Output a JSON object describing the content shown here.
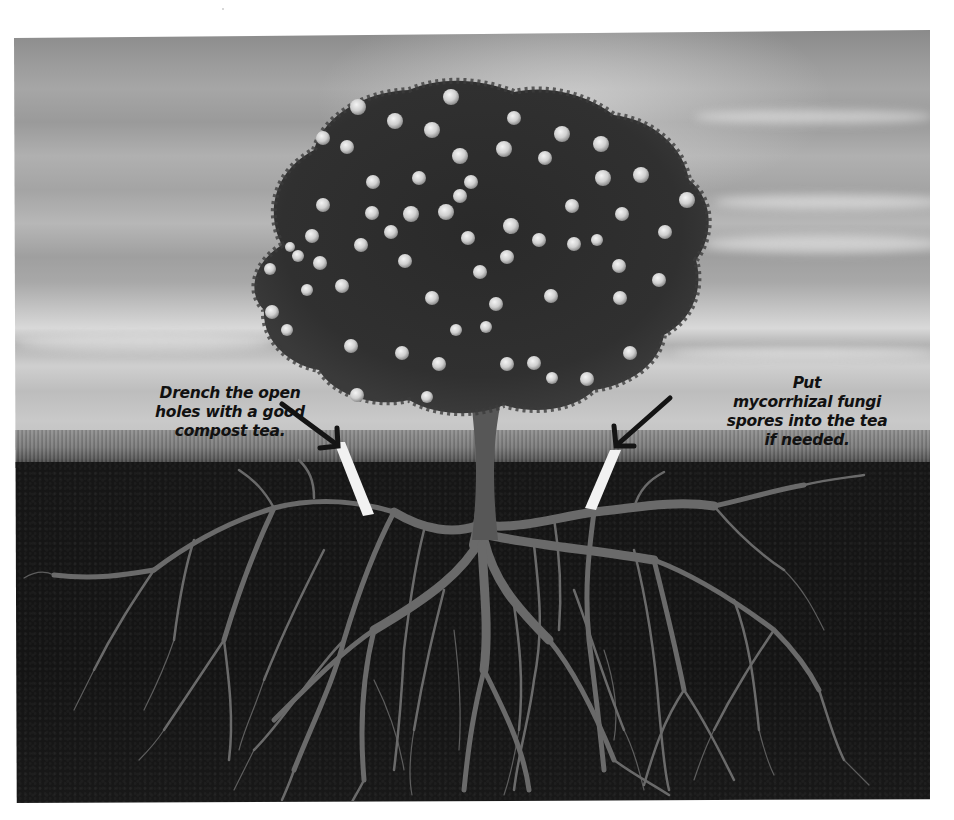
{
  "figure": {
    "colors": {
      "sky": "#a8a8a8",
      "grass": "#7a7a7a",
      "soil": "#151515",
      "roots": "#6a6a6a",
      "foliage": "#2b2b2b",
      "fruit": "#d6d6d6",
      "hole_tube": "#f2f2f2",
      "arrow": "#141414",
      "text": "#111111"
    }
  },
  "annotations": {
    "left": {
      "lines": [
        "Drench the open",
        "holes with a good",
        "compost tea."
      ]
    },
    "right": {
      "lines": [
        "Put",
        "mycorrhizal fungi",
        "spores into the tea",
        "if needed."
      ]
    }
  },
  "icons": {
    "left_arrow": "arrow-down-right",
    "right_arrow": "arrow-down-left"
  }
}
